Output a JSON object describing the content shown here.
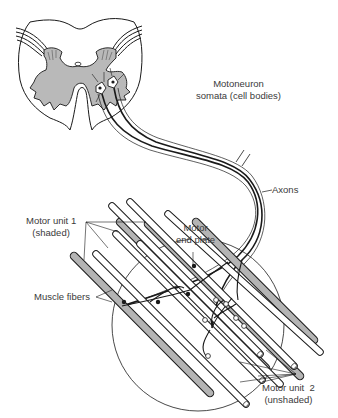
{
  "diagram": {
    "type": "anatomical illustration",
    "colors": {
      "gray_matter": "#b9b9b9",
      "shaded_fiber": "#b4b4b4",
      "unshaded_fiber": "#ffffff",
      "line": "#1a1a1a",
      "label_text": "#3a3a3a"
    },
    "labels": {
      "motoneuron": {
        "line1": "Motoneuron",
        "line2": "somata (cell bodies)"
      },
      "axons": {
        "line1": "Axons"
      },
      "motor_end_plate": {
        "line1": "Motor",
        "line2": "end plate"
      },
      "motor_unit_1": {
        "line1": "Motor unit 1",
        "line2": "(shaded)"
      },
      "muscle_fibers": {
        "line1": "Muscle fibers"
      },
      "motor_unit_2": {
        "line1": "Motor unit  2",
        "line2": "(unshaded)"
      }
    },
    "components": [
      "spinal-cord-cross-section",
      "motoneuron-somata",
      "axons",
      "muscle-fibers",
      "motor-end-plates",
      "magnifying-circle"
    ]
  }
}
